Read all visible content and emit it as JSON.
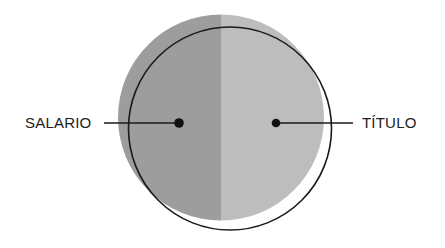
{
  "diagram": {
    "labels": {
      "left": "SALARIO",
      "right": "TÍTULO"
    },
    "colors": {
      "left_half": "#9d9d9d",
      "right_half": "#bdbdbd",
      "outline": "#1a1a1a",
      "dot": "#111111",
      "text": "#222222",
      "background": "#ffffff"
    }
  }
}
